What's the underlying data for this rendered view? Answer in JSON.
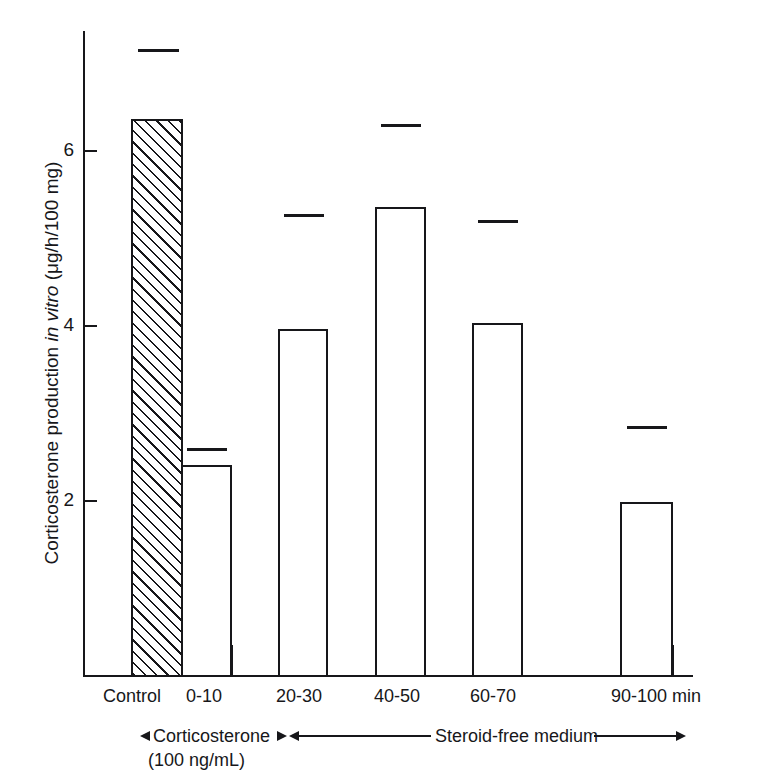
{
  "chart_data": {
    "type": "bar",
    "title": "",
    "xlabel": "",
    "ylabel": "Corticosterone production in vitro  (μg/h/100 mg)",
    "ylabel_parts": {
      "pre": "Corticosterone production ",
      "italic": "in vitro",
      "post": "  (μg/h/100 mg)"
    },
    "categories": [
      "Control",
      "0-10",
      "20-30",
      "40-50",
      "60-70",
      "90-100 min"
    ],
    "values": [
      6.35,
      2.4,
      3.95,
      5.35,
      4.02,
      1.98
    ],
    "error_upper": [
      7.15,
      2.6,
      5.27,
      6.3,
      5.2,
      2.85
    ],
    "bar_fill": [
      "hatched",
      "open",
      "open",
      "open",
      "open",
      "open"
    ],
    "ylim": [
      0,
      7.4
    ],
    "ytick_values": [
      2,
      4,
      6
    ],
    "ytick_labels": [
      "2",
      "4",
      "6"
    ],
    "yminor_values": [
      1,
      3,
      5,
      7
    ],
    "grid": false,
    "legend": "none",
    "line_color": "#17171a",
    "bar_face_color": "#ffffff",
    "annotations": [
      {
        "label": "Corticosterone",
        "sublabel": "(100 ng/mL)",
        "span": [
          "Control",
          "0-10"
        ],
        "style": "double-arrow"
      },
      {
        "label": "Steroid-free medium",
        "sublabel": "",
        "span": [
          "20-30",
          "90-100 min"
        ],
        "style": "double-arrow"
      }
    ]
  },
  "axis": {
    "y_tick_2": "2",
    "y_tick_4": "4",
    "y_tick_6": "6"
  },
  "xlabels": {
    "c0": "Control",
    "c1": "0-10",
    "c2": "20-30",
    "c3": "40-50",
    "c4": "60-70",
    "c5": "90-100 min"
  },
  "annotation_text": {
    "corticosterone": "Corticosterone",
    "concentration": "(100 ng/mL)",
    "steroid_free": "Steroid-free medium"
  }
}
